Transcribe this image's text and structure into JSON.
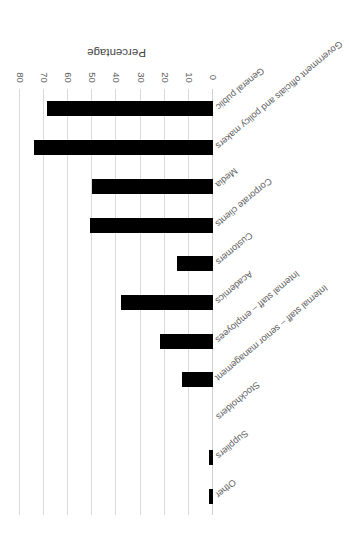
{
  "chart_data": {
    "type": "bar",
    "orientation": "horizontal",
    "title": "",
    "subtitle": "",
    "xlabel": "Percentage",
    "ylabel": "",
    "xlim": [
      0,
      80
    ],
    "xticks": [
      0,
      10,
      20,
      30,
      40,
      50,
      60,
      70,
      80
    ],
    "xtick_labels": [
      "0",
      "10",
      "20",
      "30",
      "40",
      "50",
      "60",
      "70",
      "80"
    ],
    "grid": true,
    "grid_axis": "x",
    "legend": false,
    "legend_position": "none",
    "annotations": [],
    "bar_color": "#000000",
    "gridline_color": "#d9d9d9",
    "label_color": "#5e5e5e",
    "categories": [
      "General public",
      "Government officials and policy makers",
      "Media",
      "Corporate clients",
      "Customers",
      "Academics",
      "Internal staff – employees",
      "Internal staff – senior management",
      "Stockholders",
      "Suppliers",
      "Other"
    ],
    "values": [
      69,
      74,
      50,
      51,
      15,
      38,
      22,
      13,
      0,
      1.5,
      1.5
    ]
  },
  "figure": {
    "rotation_degrees": 180,
    "background_color": "#ffffff"
  }
}
